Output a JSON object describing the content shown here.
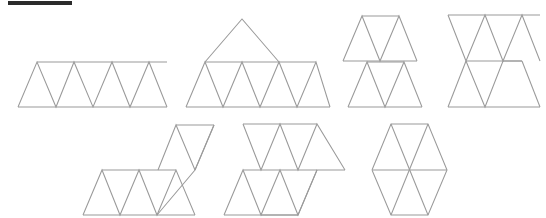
{
  "figure": {
    "title": "",
    "background_color": "#ffffff",
    "stroke_color": "#9a9a9a",
    "corner_mark": {
      "name": "top-left-rule",
      "color": "#2b2b2b",
      "x": 8,
      "y": 1,
      "width": 64,
      "height": 4
    },
    "geometry": {
      "triangle_side": 37,
      "triangle_height": 32,
      "units": "pixels"
    },
    "shapes": [
      {
        "id": "net-1",
        "label": "hexiamond-straight-strip",
        "triangle_count": 6,
        "description": "Single row strip of six alternating up and down triangles",
        "row": "top",
        "position_index": 1,
        "bbox": {
          "x": 18,
          "y": 62,
          "width": 160,
          "height": 45
        },
        "polylines": [
          "18,107 37,62 56,107 74,62 93,107 112,62 130,107 149,62 167,107",
          "37,62 167,62",
          "18,107 167,107"
        ]
      },
      {
        "id": "net-2",
        "label": "hexiamond-row-five-plus-peak",
        "triangle_count": 6,
        "description": "Row of five triangles with one upward triangle stacked on the second position",
        "row": "top",
        "position_index": 2,
        "bbox": {
          "x": 186,
          "y": 19,
          "width": 144,
          "height": 88
        },
        "polylines": [
          "186,107 205,62 223,107 242,62 260,107 279,62 297,107 316,62 330,107",
          "205,62 316,62",
          "186,107 330,107",
          "205,62 242,19 279,62"
        ]
      },
      {
        "id": "net-3",
        "label": "hexiamond-two-separate-rows",
        "triangle_count": 6,
        "description": "Two stacked rows of three triangles, upper row offset, rows meeting along a shared horizontal edge",
        "row": "top",
        "position_index": 3,
        "bbox": {
          "x": 343,
          "y": 16,
          "width": 88,
          "height": 91
        },
        "polylines": [
          "343,61 362,16 380,61 399,16 417,61",
          "362,16 399,16",
          "343,61 417,61",
          "348,107 367,62 385,107 404,62 422,107",
          "367,62 404,62",
          "348,107 422,107"
        ]
      },
      {
        "id": "net-4",
        "label": "hexiamond-interlocked-rows",
        "triangle_count": 6,
        "description": "Two rows of three triangles interlocked about a common middle horizontal edge forming an hourglass lattice",
        "row": "top",
        "position_index": 4,
        "bbox": {
          "x": 448,
          "y": 15,
          "width": 92,
          "height": 92
        },
        "polylines": [
          "448,15 466,61 485,15 503,61 522,15 540,61",
          "448,15 540,15",
          "466,61 522,61",
          "448,15 448,15",
          "466,61 485,107 503,61 522,61",
          "466,61 448,107 448,107",
          "448,107 540,107",
          "522,61 540,107"
        ]
      },
      {
        "id": "net-5",
        "label": "hexiamond-staircase",
        "triangle_count": 6,
        "description": "Staircase net: a lower rhombus row stepping up to an upper rhombus row",
        "row": "bottom",
        "position_index": 5,
        "bbox": {
          "x": 83,
          "y": 125,
          "width": 132,
          "height": 90
        },
        "polylines": [
          "83,215 102,170 120,215 139,170 157,215 176,170 195,215",
          "102,170 176,170",
          "83,215 195,215",
          "158,170 176,125 195,170",
          "176,125 214,125",
          "195,170 214,125",
          "157,215 195,170 214,125"
        ]
      },
      {
        "id": "net-6",
        "label": "hexiamond-butterfly",
        "triangle_count": 6,
        "description": "Butterfly / S-shaped net: lower row of three triangles joined to an upper row of three rotated about the shared central vertex",
        "row": "bottom",
        "position_index": 6,
        "bbox": {
          "x": 224,
          "y": 124,
          "width": 122,
          "height": 91
        },
        "polylines": [
          "224,215 243,170 261,215 280,170 298,215 317,170",
          "243,170 317,170",
          "224,215 298,215",
          "261,215 298,215 317,170 345,170",
          "243,124 261,170 280,124 298,170 317,124 345,170",
          "243,124 317,124"
        ]
      },
      {
        "id": "net-7",
        "label": "hexiamond-hexagon",
        "triangle_count": 6,
        "description": "Regular hexagon formed of six triangles meeting at a central vertex",
        "row": "bottom",
        "position_index": 7,
        "bbox": {
          "x": 372,
          "y": 124,
          "width": 96,
          "height": 91
        },
        "polylines": [
          "372,170 391,124 428,124 447,170 428,215 391,215 372,170",
          "372,170 447,170",
          "391,124 428,215",
          "428,124 391,215"
        ]
      }
    ]
  }
}
